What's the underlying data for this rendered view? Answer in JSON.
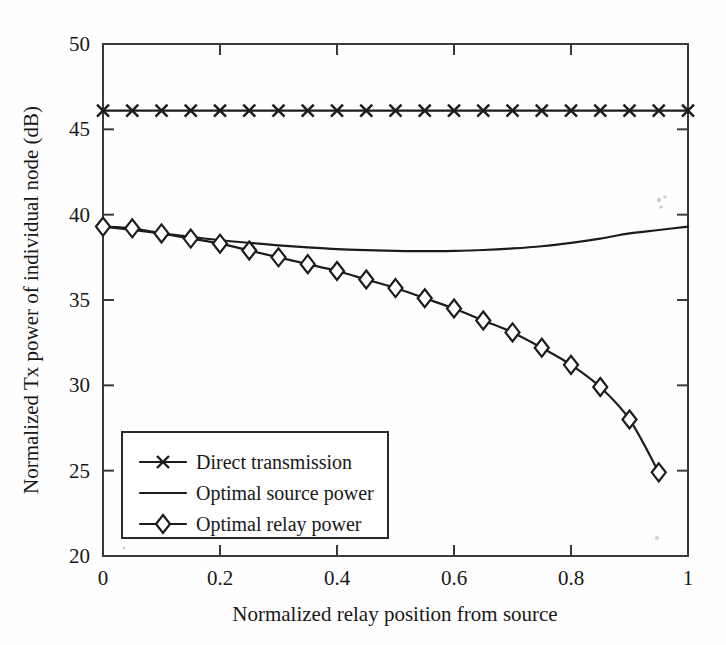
{
  "chart_data": {
    "type": "line",
    "title": "",
    "xlabel": "Normalized relay position from source",
    "ylabel": "Normalized Tx power of individual node (dB)",
    "xlim": [
      0,
      1
    ],
    "ylim": [
      20,
      50
    ],
    "xticks": [
      0,
      0.2,
      0.4,
      0.6,
      0.8,
      1
    ],
    "xtick_labels": [
      "0",
      "0.2",
      "0.4",
      "0.6",
      "0.8",
      "1"
    ],
    "yticks": [
      20,
      25,
      30,
      35,
      40,
      45,
      50
    ],
    "ytick_labels": [
      "20",
      "25",
      "30",
      "35",
      "40",
      "45",
      "50"
    ],
    "grid": false,
    "legend_position": "lower left",
    "series": [
      {
        "name": "Direct transmission",
        "marker": "x",
        "x": [
          0,
          0.05,
          0.1,
          0.15,
          0.2,
          0.25,
          0.3,
          0.35,
          0.4,
          0.45,
          0.5,
          0.55,
          0.6,
          0.65,
          0.7,
          0.75,
          0.8,
          0.85,
          0.9,
          0.95,
          1
        ],
        "values": [
          46.1,
          46.1,
          46.1,
          46.1,
          46.1,
          46.1,
          46.1,
          46.1,
          46.1,
          46.1,
          46.1,
          46.1,
          46.1,
          46.1,
          46.1,
          46.1,
          46.1,
          46.1,
          46.1,
          46.1,
          46.1
        ]
      },
      {
        "name": "Optimal source power",
        "marker": "none",
        "x": [
          0,
          0.05,
          0.1,
          0.15,
          0.2,
          0.25,
          0.3,
          0.35,
          0.4,
          0.45,
          0.5,
          0.55,
          0.6,
          0.65,
          0.7,
          0.75,
          0.8,
          0.85,
          0.9,
          0.95,
          1
        ],
        "values": [
          39.3,
          39.1,
          38.9,
          38.7,
          38.5,
          38.35,
          38.2,
          38.08,
          37.98,
          37.92,
          37.88,
          37.86,
          37.88,
          37.93,
          38.02,
          38.15,
          38.35,
          38.6,
          38.9,
          39.1,
          39.3
        ]
      },
      {
        "name": "Optimal relay power",
        "marker": "diamond",
        "x": [
          0,
          0.05,
          0.1,
          0.15,
          0.2,
          0.25,
          0.3,
          0.35,
          0.4,
          0.45,
          0.5,
          0.55,
          0.6,
          0.65,
          0.7,
          0.75,
          0.8,
          0.85,
          0.9,
          0.95
        ],
        "values": [
          39.3,
          39.2,
          38.9,
          38.6,
          38.3,
          37.9,
          37.5,
          37.1,
          36.7,
          36.2,
          35.7,
          35.1,
          34.5,
          33.8,
          33.1,
          32.2,
          31.2,
          29.9,
          28.0,
          24.9
        ]
      }
    ]
  },
  "legend": {
    "items": [
      {
        "label": "Direct transmission",
        "marker": "x"
      },
      {
        "label": "Optimal source power",
        "marker": "none"
      },
      {
        "label": "Optimal relay power",
        "marker": "diamond"
      }
    ]
  },
  "colors": {
    "line": "#1c1c1c",
    "frame": "#3a3a3a",
    "background": "#fefefe",
    "marker_fill": "#ffffff"
  }
}
